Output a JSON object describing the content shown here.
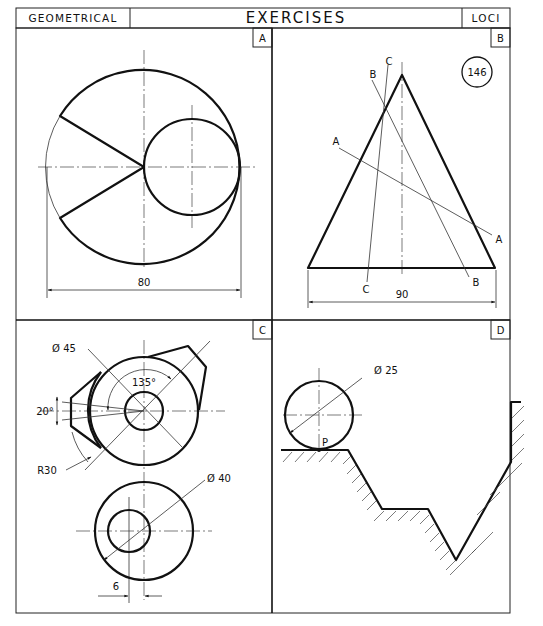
{
  "header": {
    "left": "GEOMETRICAL",
    "center": "EXERCISES",
    "right": "LOCI"
  },
  "panels": {
    "A": {
      "label": "A",
      "dimension": "80"
    },
    "B": {
      "label": "B",
      "badge": "146",
      "line_labels": {
        "a_start": "A",
        "a_end": "A",
        "b_start": "B",
        "b_end": "B",
        "c_start": "C",
        "c_end": "C"
      },
      "dimension": "90"
    },
    "C": {
      "label": "C",
      "dim_outer_diameter": "Ø 45",
      "dim_angle_135": "135°",
      "dim_angle_20": "20°",
      "dim_radius": "R30",
      "dim_wheel_diameter": "Ø 40",
      "dim_offset": "6"
    },
    "D": {
      "label": "D",
      "dim_diameter": "Ø 25",
      "point_label": "P"
    }
  }
}
